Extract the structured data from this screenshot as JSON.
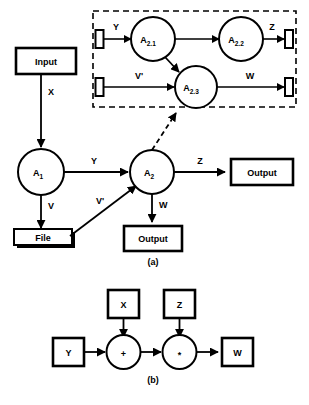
{
  "figure": {
    "title_a": "(a)",
    "title_b": "(b)",
    "background_color": "#ffffff",
    "stroke_color": "#000000"
  },
  "part_a": {
    "caption": "(a)",
    "boxes": [
      {
        "id": "input-top",
        "label": "Input"
      },
      {
        "id": "file",
        "label": "File"
      },
      {
        "id": "output-right",
        "label": "Output"
      },
      {
        "id": "output-bottom",
        "label": "Output"
      }
    ],
    "nodes": [
      {
        "id": "a1",
        "base": "A",
        "sub": "1"
      },
      {
        "id": "a2",
        "base": "A",
        "sub": "2"
      }
    ],
    "edges": [
      {
        "id": "input-to-a1",
        "label": "X"
      },
      {
        "id": "a1-to-a2",
        "label": "Y"
      },
      {
        "id": "a1-to-file",
        "label": "V"
      },
      {
        "id": "file-to-a2",
        "label": "V'"
      },
      {
        "id": "a2-to-output-right",
        "label": "Z"
      },
      {
        "id": "a2-to-output-bottom",
        "label": "W"
      }
    ],
    "refinement": {
      "id": "a2-refinement-link",
      "style": "dashed-arrow",
      "description": "A2 refines into dashed box"
    }
  },
  "refinement_box": {
    "id": "a2-expansion",
    "border_style": "dashed",
    "nodes": [
      {
        "id": "a21",
        "base": "A",
        "sub": "2.1"
      },
      {
        "id": "a22",
        "base": "A",
        "sub": "2.2"
      },
      {
        "id": "a23",
        "base": "A",
        "sub": "2.3"
      }
    ],
    "ports": [
      {
        "id": "port-in-top",
        "side": "left"
      },
      {
        "id": "port-in-bottom",
        "side": "left"
      },
      {
        "id": "port-out-top",
        "side": "right"
      },
      {
        "id": "port-out-bottom",
        "side": "right"
      }
    ],
    "edges": [
      {
        "id": "port-y-to-a21",
        "label": "Y"
      },
      {
        "id": "a21-to-a22",
        "label": ""
      },
      {
        "id": "a22-to-port-z",
        "label": "Z"
      },
      {
        "id": "a21-to-a23",
        "label": ""
      },
      {
        "id": "port-vprime-to-a23",
        "label": "V'"
      },
      {
        "id": "a23-to-port-w",
        "label": "W"
      }
    ]
  },
  "part_b": {
    "caption": "(b)",
    "boxes": [
      {
        "id": "box-x",
        "label": "X"
      },
      {
        "id": "box-z",
        "label": "Z"
      },
      {
        "id": "box-y",
        "label": "Y"
      },
      {
        "id": "box-w",
        "label": "W"
      }
    ],
    "operators": [
      {
        "id": "op-plus",
        "label": "+"
      },
      {
        "id": "op-times",
        "label": "*"
      }
    ],
    "edges": [
      {
        "id": "y-to-plus",
        "label": ""
      },
      {
        "id": "x-to-plus",
        "label": ""
      },
      {
        "id": "plus-to-times",
        "label": ""
      },
      {
        "id": "z-to-times",
        "label": ""
      },
      {
        "id": "times-to-w",
        "label": ""
      }
    ]
  }
}
